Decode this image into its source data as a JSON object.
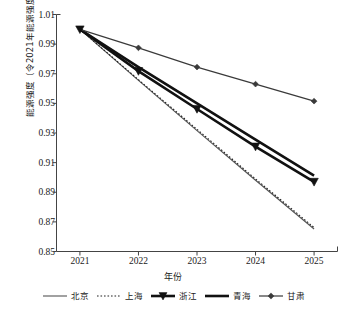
{
  "chart_data": {
    "type": "line",
    "title": "",
    "xlabel": "年份",
    "ylabel": "能源强度（令2021年能源强度=1）",
    "x": [
      2021,
      2022,
      2023,
      2024,
      2025
    ],
    "categories": [
      "2021",
      "2022",
      "2023",
      "2024",
      "2025"
    ],
    "xticklabels": [
      "2021",
      "2022",
      "2023",
      "2024",
      "2025"
    ],
    "yticklabels": [
      "0.85",
      "0.87",
      "0.89",
      "0.91",
      "0.93",
      "0.95",
      "0.97",
      "0.99",
      "1.01"
    ],
    "yticks": [
      0.85,
      0.87,
      0.89,
      0.91,
      0.93,
      0.95,
      0.97,
      0.99,
      1.01
    ],
    "xlim": [
      2020.6,
      2025.4
    ],
    "ylim": [
      0.85,
      1.01
    ],
    "grid": false,
    "legend_position": "bottom",
    "series": [
      {
        "name": "北京",
        "values": [
          1.0,
          0.9655,
          0.9316,
          0.8981,
          0.8652
        ],
        "style": "solid-thin",
        "color": "#555555",
        "marker": "none",
        "width": 1.1
      },
      {
        "name": "上海",
        "values": [
          1.0,
          0.966,
          0.9325,
          0.899,
          0.8662
        ],
        "style": "dotted",
        "color": "#222222",
        "marker": "none",
        "width": 1.1
      },
      {
        "name": "浙江",
        "values": [
          1.0,
          0.9718,
          0.9462,
          0.9208,
          0.897
        ],
        "style": "solid-thick",
        "color": "#111111",
        "marker": "triangle",
        "width": 2.6
      },
      {
        "name": "青海",
        "values": [
          1.0,
          0.9745,
          0.95,
          0.9255,
          0.9012
        ],
        "style": "solid-thick",
        "color": "#111111",
        "marker": "none",
        "width": 2.6
      },
      {
        "name": "甘肃",
        "values": [
          1.0,
          0.9875,
          0.9745,
          0.963,
          0.9515
        ],
        "style": "solid-thin",
        "color": "#3a3a3a",
        "marker": "diamond",
        "width": 1.2
      }
    ],
    "axis_color": "#444444"
  },
  "legend": {
    "items": [
      {
        "label": "北京",
        "key": "line-solid-thin"
      },
      {
        "label": "上海",
        "key": "line-dotted"
      },
      {
        "label": "浙江",
        "key": "line-thick-triangle"
      },
      {
        "label": "青海",
        "key": "line-thick-solid"
      },
      {
        "label": "甘肃",
        "key": "line-thin-diamond"
      }
    ]
  }
}
